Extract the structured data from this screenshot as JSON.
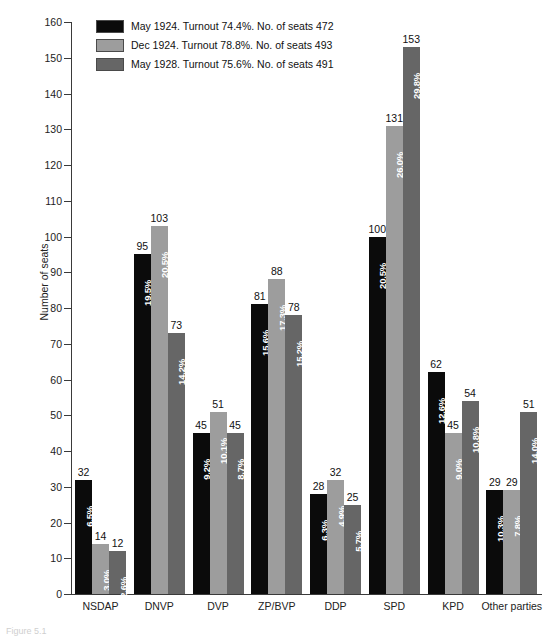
{
  "chart_data": {
    "type": "bar",
    "title": "",
    "xlabel": "",
    "ylabel": "Number of seats",
    "ylim": [
      0,
      160
    ],
    "ytick_step": 10,
    "yticks": [
      0,
      10,
      20,
      30,
      40,
      50,
      60,
      70,
      80,
      90,
      100,
      110,
      120,
      130,
      140,
      150,
      160
    ],
    "grid": false,
    "legend_position": "top-left",
    "categories": [
      "NSDAP",
      "DNVP",
      "DVP",
      "ZP/BVP",
      "DDP",
      "SPD",
      "KPD",
      "Other parties"
    ],
    "series": [
      {
        "name": "May 1924. Turnout 74.4%. No. of seats 472",
        "short_name": "May 1924",
        "color": "#0b0b0b",
        "turnout": "74.4%",
        "total_seats": 472,
        "values": [
          32,
          95,
          45,
          81,
          28,
          100,
          62,
          29
        ],
        "percent_labels": [
          "6.5%",
          "19.5%",
          "9.2%",
          "15.6%",
          "6.3%",
          "20.5%",
          "12.6%",
          "10.3%"
        ]
      },
      {
        "name": "Dec 1924. Turnout 78.8%. No. of seats 493",
        "short_name": "Dec 1924",
        "color": "#9d9d9d",
        "turnout": "78.8%",
        "total_seats": 493,
        "values": [
          14,
          103,
          51,
          88,
          32,
          131,
          45,
          29
        ],
        "percent_labels": [
          "3.0%",
          "20.5%",
          "10.1%",
          "17.3%",
          "4.9%",
          "26.0%",
          "9.0%",
          "7.8%"
        ]
      },
      {
        "name": "May 1928. Turnout 75.6%. No. of seats 491",
        "short_name": "May 1928",
        "color": "#666666",
        "turnout": "75.6%",
        "total_seats": 491,
        "values": [
          12,
          73,
          45,
          78,
          25,
          153,
          54,
          51
        ],
        "percent_labels": [
          "2.6%",
          "14.2%",
          "8.7%",
          "15.2%",
          "5.7%",
          "29.8%",
          "10.8%",
          "14.0%"
        ]
      }
    ]
  },
  "legend": {
    "rows": [
      {
        "swatch": "legend-swatch-may-1924",
        "label": "May 1924. Turnout 74.4%. No. of seats 472"
      },
      {
        "swatch": "legend-swatch-dec-1924",
        "label": "Dec 1924. Turnout 78.8%. No. of seats 493"
      },
      {
        "swatch": "legend-swatch-may-1928",
        "label": "May 1928. Turnout 75.6%. No. of seats 491"
      }
    ]
  },
  "caption": {
    "text": "Figure 5.1"
  }
}
